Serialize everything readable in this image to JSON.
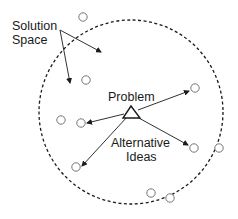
{
  "diagram": {
    "labels": {
      "solution_space_line1": "Solution",
      "solution_space_line2": "Space",
      "problem": "Problem",
      "alternative_ideas_line1": "Alternative",
      "alternative_ideas_line2": "Ideas"
    },
    "colors": {
      "stroke": "#1a1a1a",
      "idea_stroke": "#777777",
      "background": "#ffffff"
    },
    "boundary": {
      "shape": "dashed-circle",
      "cx": 131,
      "cy": 112,
      "r": 92
    },
    "problem_node": {
      "shape": "triangle"
    },
    "idea_nodes": [
      {
        "cx": 83,
        "cy": 17
      },
      {
        "cx": 86,
        "cy": 80
      },
      {
        "cx": 195,
        "cy": 88
      },
      {
        "cx": 61,
        "cy": 120
      },
      {
        "cx": 81,
        "cy": 123
      },
      {
        "cx": 76,
        "cy": 167
      },
      {
        "cx": 194,
        "cy": 148
      },
      {
        "cx": 219,
        "cy": 148
      },
      {
        "cx": 151,
        "cy": 193
      },
      {
        "cx": 170,
        "cy": 198
      }
    ]
  }
}
